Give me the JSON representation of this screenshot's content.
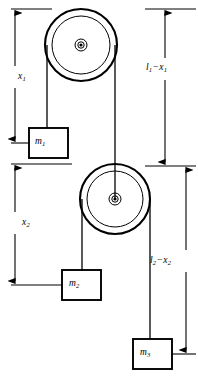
{
  "figure": {
    "type": "physics-free-body-diagram",
    "background": "#ffffff",
    "stroke": "#000000",
    "width": 198,
    "height": 378
  },
  "labels": {
    "x1": {
      "base": "x",
      "sub": "1",
      "text": "x₁"
    },
    "l1_minus_x1": {
      "term1_base": "l",
      "term1_sub": "1",
      "operator": "−",
      "term2_base": "x",
      "term2_sub": "1",
      "text": "l₁ − x₁"
    },
    "x2": {
      "base": "x",
      "sub": "2",
      "text": "x₂"
    },
    "l2_minus_x2": {
      "term1_base": "l",
      "term1_sub": "2",
      "operator": "−",
      "term2_base": "x",
      "term2_sub": "2",
      "text": "l₂ − x₂"
    },
    "m1": {
      "base": "m",
      "sub": "1",
      "text": "m₁"
    },
    "m2": {
      "base": "m",
      "sub": "2",
      "text": "m₂"
    },
    "m3": {
      "base": "m",
      "sub": "3",
      "text": "m₃"
    }
  },
  "pulleys": [
    {
      "name": "upper-pulley",
      "cx": 81,
      "cy": 45,
      "r_outer": 36,
      "r_inner": 29,
      "r_hub_outer": 6,
      "r_hub_inner": 3.2,
      "r_center_dot": 1.6
    },
    {
      "name": "lower-pulley",
      "cx": 115,
      "cy": 199,
      "r_outer": 35,
      "r_inner": 28,
      "r_hub_outer": 6,
      "r_hub_inner": 3.2,
      "r_center_dot": 1.6
    }
  ],
  "masses": [
    {
      "name": "mass-1",
      "x": 29,
      "y": 128,
      "w": 39,
      "h": 30,
      "label": "m₁"
    },
    {
      "name": "mass-2",
      "x": 62,
      "y": 270,
      "w": 39,
      "h": 30,
      "label": "m₂"
    },
    {
      "name": "mass-3",
      "x": 133,
      "y": 339,
      "w": 39,
      "h": 30,
      "label": "m₃"
    }
  ],
  "dimensions": [
    {
      "name": "x1",
      "axis_x": 15,
      "from_y": 9,
      "to_y": 143,
      "label": "x₁",
      "arrow_top": true,
      "arrow_bottom": true
    },
    {
      "name": "l1-minus-x1",
      "axis_x": 165,
      "from_y": 9,
      "to_y": 166,
      "label": "l₁ − x₁",
      "arrow_top": true,
      "arrow_bottom": true
    },
    {
      "name": "x2",
      "axis_x": 15,
      "from_y": 164,
      "to_y": 285,
      "label": "x₂",
      "arrow_top": true,
      "arrow_bottom": true
    },
    {
      "name": "l2-minus-x2",
      "axis_x": 186,
      "from_y": 166,
      "to_y": 354,
      "label": "l₂ − x₂",
      "arrow_top": true,
      "arrow_bottom": true
    }
  ],
  "cords": [
    {
      "name": "cord-upper-left",
      "from": [
        47,
        45
      ],
      "to": [
        47,
        128
      ]
    },
    {
      "name": "cord-upper-right",
      "from": [
        115,
        45
      ],
      "to": [
        115,
        199
      ]
    },
    {
      "name": "cord-lower-left",
      "from": [
        82,
        199
      ],
      "to": [
        82,
        270
      ]
    },
    {
      "name": "cord-lower-right",
      "from": [
        150,
        199
      ],
      "to": [
        150,
        339
      ]
    }
  ]
}
